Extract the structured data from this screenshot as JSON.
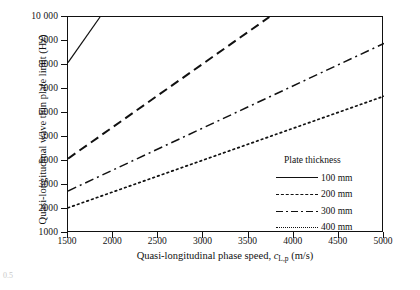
{
  "chart_data": {
    "type": "line",
    "title": "",
    "xlabel": "Quasi-longitudinal phase speed, c_{L,p} (m/s)",
    "xlabel_main": "Quasi-longitudinal phase speed, ",
    "xlabel_symbol": "c",
    "xlabel_subscript": "L,p",
    "xlabel_units": " (m/s)",
    "ylabel": "Quasi-longitudinal wave thin plate limit (Hz)",
    "xlim": [
      1500,
      5000
    ],
    "ylim": [
      1000,
      10000
    ],
    "xticks": [
      1500,
      2000,
      2500,
      3000,
      3500,
      4000,
      4500,
      5000
    ],
    "xtick_labels": [
      "1500",
      "2000",
      "2500",
      "3000",
      "3500",
      "4000",
      "4500",
      "5000"
    ],
    "yticks": [
      1000,
      2000,
      3000,
      4000,
      5000,
      6000,
      7000,
      8000,
      9000,
      10000
    ],
    "ytick_labels": [
      "1000",
      "2000",
      "3000",
      "4000",
      "5000",
      "6000",
      "7000",
      "8000",
      "9000",
      "10 000"
    ],
    "grid": false,
    "legend_position": "inside lower-right",
    "legend_title": "Plate thickness",
    "series": [
      {
        "name": "100 mm",
        "style": "solid",
        "x": [
          1500,
          1855
        ],
        "y": [
          8100,
          10000
        ],
        "clipped_at_top": true
      },
      {
        "name": "200 mm",
        "style": "dashed",
        "x": [
          1500,
          3730
        ],
        "y": [
          4100,
          10000
        ],
        "clipped_at_top": true
      },
      {
        "name": "300 mm",
        "style": "dash-dot",
        "x": [
          1500,
          5000
        ],
        "y": [
          2750,
          8900
        ],
        "clipped_at_top": false
      },
      {
        "name": "400 mm",
        "style": "dotted",
        "x": [
          1500,
          5000
        ],
        "y": [
          2050,
          6700
        ],
        "clipped_at_top": false
      }
    ]
  },
  "legend": {
    "title": "Plate thickness",
    "entries": [
      {
        "label": "100 mm",
        "style": "solid"
      },
      {
        "label": "200 mm",
        "style": "dashed"
      },
      {
        "label": "300 mm",
        "style": "dash-dot"
      },
      {
        "label": "400 mm",
        "style": "dotted"
      }
    ]
  },
  "caption_fragment": "0.5",
  "colors": {
    "line": "#111111",
    "axis": "#111111",
    "background": "#ffffff"
  }
}
